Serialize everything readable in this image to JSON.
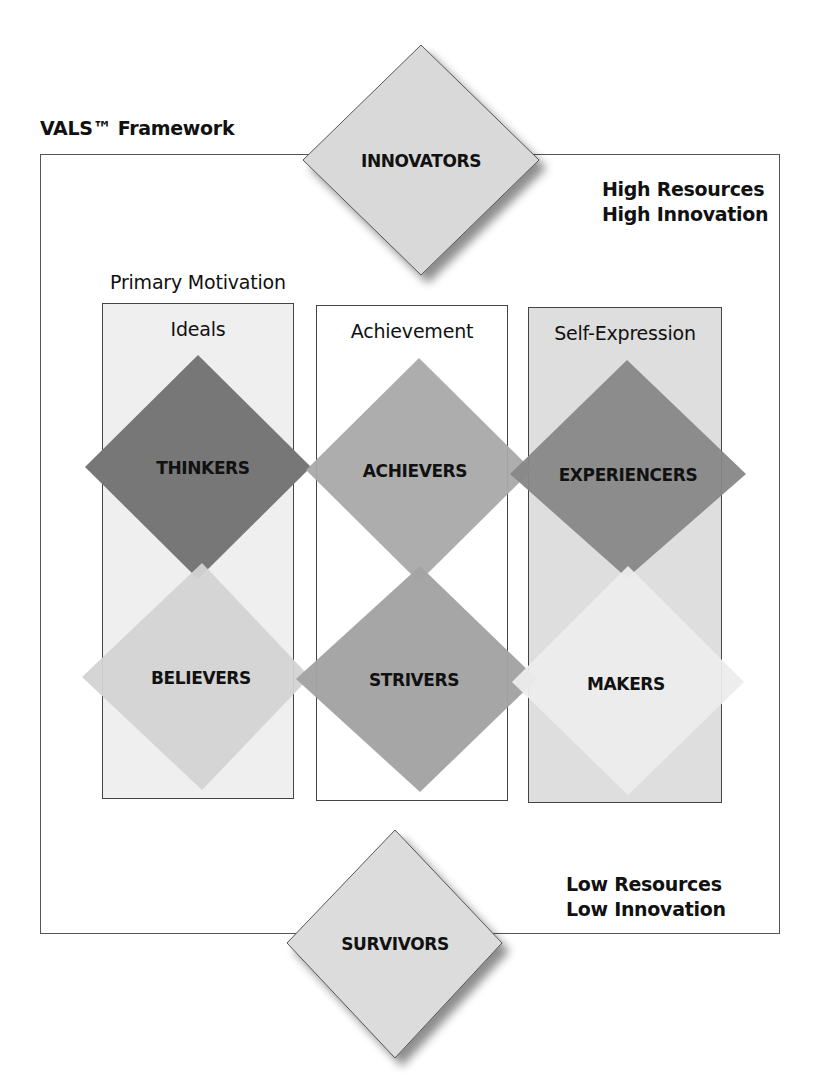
{
  "header": {
    "title": "VALS™ Framework"
  },
  "axis_labels": {
    "high": [
      "High Resources",
      "High Innovation"
    ],
    "low": [
      "Low Resources",
      "Low Innovation"
    ]
  },
  "primary_motivation": {
    "label": "Primary Motivation",
    "columns": [
      {
        "id": "ideals",
        "label": "Ideals",
        "background": "#efefef"
      },
      {
        "id": "achievement",
        "label": "Achievement",
        "background": "#ffffff"
      },
      {
        "id": "self-expression",
        "label": "Self-Expression",
        "background": "#dedede"
      }
    ]
  },
  "segments": {
    "top": {
      "label": "INNOVATORS",
      "color": "#d9d9d9"
    },
    "bottom": {
      "label": "SURVIVORS",
      "color": "#dcdcdc"
    },
    "grid": [
      {
        "label": "THINKERS",
        "column": "Ideals",
        "row": "high",
        "color": "#777777"
      },
      {
        "label": "ACHIEVERS",
        "column": "Achievement",
        "row": "high",
        "color": "#a9a9a9"
      },
      {
        "label": "EXPERIENCERS",
        "column": "Self-Expression",
        "row": "high",
        "color": "#878787"
      },
      {
        "label": "BELIEVERS",
        "column": "Ideals",
        "row": "low",
        "color": "#d3d3d3"
      },
      {
        "label": "STRIVERS",
        "column": "Achievement",
        "row": "low",
        "color": "#a3a3a3"
      },
      {
        "label": "MAKERS",
        "column": "Self-Expression",
        "row": "low",
        "color": "#ececec"
      }
    ]
  }
}
